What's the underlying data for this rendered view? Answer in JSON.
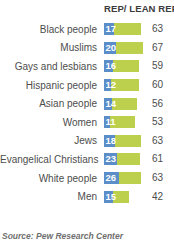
{
  "chart_data": {
    "type": "bar",
    "title": "",
    "subtitle": "",
    "xlabel": "",
    "ylabel": "",
    "grid": false,
    "legend_position": "top",
    "orientation": "horizontal",
    "stacked": true,
    "column_header": "REP/ LEAN REP",
    "source": "Source: Pew Research Center",
    "categories": [
      "Black people",
      "Muslims",
      "Gays and lesbians",
      "Hispanic people",
      "Asian people",
      "Women",
      "Jews",
      "Evangelical Christians",
      "White people",
      "Men"
    ],
    "series": [
      {
        "name": "inner-value",
        "color": "#5b8ec9",
        "values": [
          17,
          20,
          16,
          12,
          14,
          11,
          18,
          23,
          26,
          15
        ]
      },
      {
        "name": "outer-value",
        "color": "#bcd04e",
        "values": [
          63,
          67,
          59,
          60,
          56,
          53,
          63,
          61,
          63,
          42
        ]
      }
    ],
    "rows": [
      {
        "label": "Black people",
        "inner": 17,
        "outer": 63
      },
      {
        "label": "Muslims",
        "inner": 20,
        "outer": 67
      },
      {
        "label": "Gays and lesbians",
        "inner": 16,
        "outer": 59
      },
      {
        "label": "Hispanic people",
        "inner": 12,
        "outer": 60
      },
      {
        "label": "Asian people",
        "inner": 14,
        "outer": 56
      },
      {
        "label": "Women",
        "inner": 11,
        "outer": 53
      },
      {
        "label": "Jews",
        "inner": 18,
        "outer": 63
      },
      {
        "label": "Evangelical Christians",
        "inner": 23,
        "outer": 61
      },
      {
        "label": "White people",
        "inner": 26,
        "outer": 63
      },
      {
        "label": "Men",
        "inner": 15,
        "outer": 42
      }
    ]
  }
}
